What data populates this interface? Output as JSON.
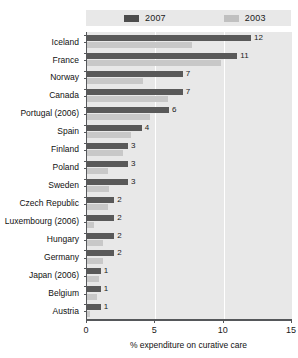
{
  "chart_data": {
    "type": "bar",
    "orientation": "horizontal",
    "title": "",
    "xlabel": "% expenditure on curative care",
    "ylabel": "",
    "xlim": [
      0,
      15
    ],
    "xticks": [
      0,
      5,
      10,
      15
    ],
    "xtick_labels": [
      "0",
      "5",
      "10",
      "15"
    ],
    "grid": true,
    "grid_axis": "x",
    "legend_position": "top",
    "categories": [
      "Iceland",
      "France",
      "Norway",
      "Canada",
      "Portugal (2006)",
      "Spain",
      "Finland",
      "Poland",
      "Sweden",
      "Czech Republic",
      "Luxembourg (2006)",
      "Hungary",
      "Germany",
      "Japan (2006)",
      "Belgium",
      "Austria"
    ],
    "series": [
      {
        "name": "2007",
        "color": "#595959",
        "values": [
          12,
          11,
          7,
          7,
          6,
          4,
          3,
          3,
          3,
          2,
          2,
          2,
          2,
          1,
          1,
          1
        ],
        "labels": [
          "12",
          "11",
          "7",
          "7",
          "6",
          "4",
          "3",
          "3",
          "3",
          "2",
          "2",
          "2",
          "2",
          "1",
          "1",
          "1"
        ]
      },
      {
        "name": "2003",
        "color": "#c8c8c8",
        "values": [
          7.7,
          9.8,
          4.1,
          5.9,
          4.6,
          3.2,
          2.6,
          1.5,
          1.6,
          1.5,
          0.5,
          1.2,
          1.2,
          0.9,
          0.7,
          0.2
        ],
        "labels": [
          "",
          "",
          "",
          "",
          "",
          "",
          "",
          "",
          "",
          "",
          "",
          "",
          "",
          "",
          "",
          ""
        ]
      }
    ]
  },
  "legend": {
    "entries": [
      {
        "label": "2007",
        "swatch": "dark"
      },
      {
        "label": "2003",
        "swatch": "light"
      }
    ]
  },
  "axis": {
    "x_title": "% expenditure on curative care"
  },
  "colors": {
    "series_2007": "#595959",
    "series_2003": "#c8c8c8",
    "plot_background": "#e8e8e8",
    "gridline": "#ffffff",
    "axis": "#55575a",
    "text": "#111111"
  }
}
